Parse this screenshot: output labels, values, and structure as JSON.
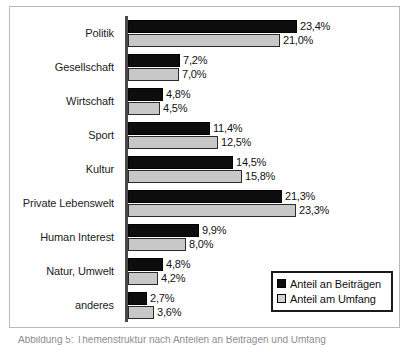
{
  "chart_data": {
    "type": "bar",
    "orientation": "horizontal",
    "title": "",
    "xlabel": "",
    "ylabel": "",
    "grid": false,
    "legend_position": "bottom-right",
    "xlim": [
      0,
      25
    ],
    "value_suffix": "%",
    "decimal_separator": ",",
    "categories": [
      "Politik",
      "Gesellschaft",
      "Wirtschaft",
      "Sport",
      "Kultur",
      "Private Lebenswelt",
      "Human Interest",
      "Natur, Umwelt",
      "anderes"
    ],
    "series": [
      {
        "name": "Anteil an Beiträgen",
        "color": "#0d0d0d",
        "values": [
          23.4,
          7.2,
          4.8,
          11.4,
          14.5,
          21.3,
          9.9,
          4.8,
          2.7
        ],
        "labels": [
          "23,4%",
          "7,2%",
          "4,8%",
          "11,4%",
          "14,5%",
          "21,3%",
          "9,9%",
          "4,8%",
          "2,7%"
        ]
      },
      {
        "name": "Anteil am Umfang",
        "color": "#c8c8c8",
        "values": [
          21.0,
          7.0,
          4.5,
          12.5,
          15.8,
          23.3,
          8.0,
          4.2,
          3.6
        ],
        "labels": [
          "21,0%",
          "7,0%",
          "4,5%",
          "12,5%",
          "15,8%",
          "23,3%",
          "8,0%",
          "4,2%",
          "3,6%"
        ]
      }
    ]
  },
  "legend": {
    "entries": [
      {
        "label": "Anteil an Beiträgen",
        "swatch": "black-square"
      },
      {
        "label": "Anteil am Umfang",
        "swatch": "light-gray-square"
      }
    ]
  },
  "caption": {
    "text": "Abbildung 5: Themenstruktur nach Anteilen an Beiträgen und Umfang"
  }
}
